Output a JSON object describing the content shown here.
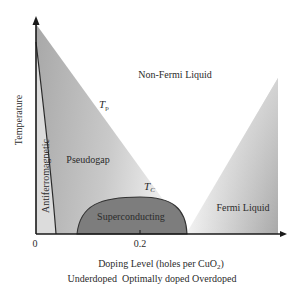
{
  "diagram": {
    "axes": {
      "y_label": "Temperature",
      "x_label": "Doping Level (holes per CuO",
      "x_label_subscript": "2",
      "x_label_close": ")",
      "x_ticks": [
        "0",
        "0.2"
      ],
      "x_regimes": "Underdoped  Optimally doped Overdoped"
    },
    "regions": {
      "non_fermi": "Non-Fermi Liquid",
      "pseudogap": "Pseudogap",
      "antiferro": "Antiferromagnetic",
      "superconducting": "Superconducting",
      "fermi": "Fermi Liquid"
    },
    "lines": {
      "tp": "T",
      "tp_sub": "p",
      "tc": "T",
      "tc_sub": "C"
    },
    "colors": {
      "axis": "#1a1a1a",
      "dome": "#7a7a7a",
      "dome_stroke": "#333333",
      "wedge_dark": "#9a9a9a",
      "wedge_light": "#f2f2f2",
      "antiferro": "#d8d8d8"
    }
  }
}
